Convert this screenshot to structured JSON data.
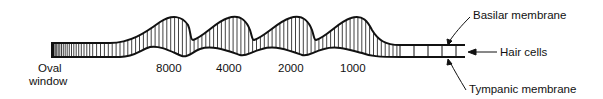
{
  "diagram": {
    "labels": {
      "oval_window_line1": "Oval",
      "oval_window_line2": "window",
      "basilar_membrane": "Basilar membrane",
      "hair_cells": "Hair cells",
      "tympanic_membrane": "Tympanic membrane"
    },
    "frequency_markers": [
      "8000",
      "4000",
      "2000",
      "1000"
    ],
    "colors": {
      "ink": "#111111",
      "background": "#ffffff"
    }
  }
}
